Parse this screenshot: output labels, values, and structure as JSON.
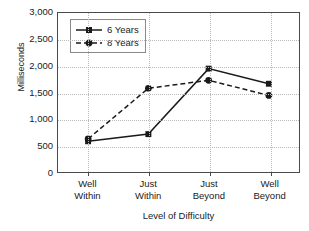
{
  "chart_data": {
    "type": "line",
    "title": "",
    "xlabel": "Level of Difficulty",
    "ylabel": "Milliseconds",
    "categories": [
      "Well Within",
      "Just Within",
      "Just Beyond",
      "Well Beyond"
    ],
    "category_lines": [
      [
        "Well",
        "Within"
      ],
      [
        "Just",
        "Within"
      ],
      [
        "Just",
        "Beyond"
      ],
      [
        "Well",
        "Beyond"
      ]
    ],
    "series": [
      {
        "name": "6 Years",
        "values": [
          580,
          715,
          1950,
          1665
        ],
        "marker": "square",
        "linestyle": "solid",
        "color": "#1a1a1a"
      },
      {
        "name": "8 Years",
        "values": [
          625,
          1580,
          1730,
          1445
        ],
        "marker": "circle",
        "linestyle": "dashed",
        "color": "#1a1a1a"
      }
    ],
    "ylim": [
      0,
      3000
    ],
    "yticks": [
      0,
      500,
      1000,
      1500,
      2000,
      2500,
      3000
    ],
    "ytick_labels": [
      "0",
      "500",
      "1,000",
      "1,500",
      "2,000",
      "2,500",
      "3,000"
    ],
    "grid": {
      "horizontal": true,
      "vertical": true,
      "style": "dotted",
      "color": "#b9b9b9"
    },
    "legend": {
      "position": "upper-left-inside",
      "entries": [
        "6 Years",
        "8 Years"
      ]
    }
  }
}
